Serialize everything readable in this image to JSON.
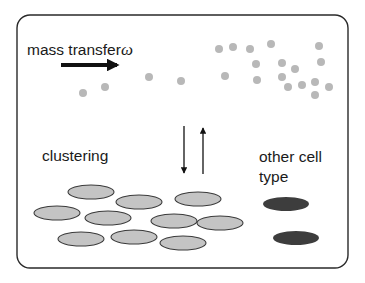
{
  "labels": {
    "mass_transfer": "mass transfer",
    "omega": "ω",
    "clustering": "clustering",
    "other_cell_line1": "other cell",
    "other_cell_line2": "type"
  },
  "colors": {
    "border": "#2a2a2a",
    "dot": "#b8b8b8",
    "cell": "#c4c4c4",
    "cell_stroke": "#3a3a3a",
    "other_cell": "#3d3d3d",
    "arrow": "#111111"
  },
  "counts": {
    "scattered_dots": 21,
    "clustered_cells": 10,
    "other_cells": 2
  }
}
